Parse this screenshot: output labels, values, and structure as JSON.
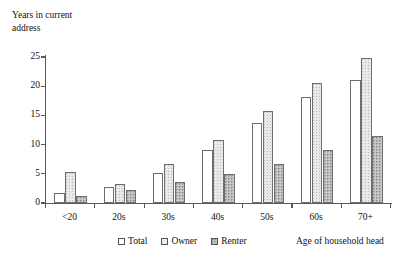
{
  "chart_data": {
    "type": "bar",
    "title": "",
    "ylabel": "Years in current address",
    "xlabel": "Age of household head",
    "categories": [
      "<20",
      "20s",
      "30s",
      "40s",
      "50s",
      "60s",
      "70+"
    ],
    "series": [
      {
        "name": "Total",
        "values": [
          1.7,
          2.8,
          5.2,
          9.0,
          13.7,
          18.2,
          21.0
        ]
      },
      {
        "name": "Owner",
        "values": [
          5.3,
          3.3,
          6.6,
          10.8,
          15.8,
          20.6,
          24.8
        ]
      },
      {
        "name": "Renter",
        "values": [
          1.2,
          2.2,
          3.6,
          5.0,
          6.7,
          9.0,
          11.4
        ]
      }
    ],
    "ylim": [
      0,
      25
    ],
    "yticks": [
      0,
      5,
      10,
      15,
      20,
      25
    ],
    "ytick_labels": [
      "0",
      "5",
      "10",
      "15",
      "20",
      "25"
    ],
    "grid": false,
    "legend_position": "bottom",
    "legend": [
      "Total",
      "Owner",
      "Renter"
    ]
  },
  "axis": {
    "y_title_line1": "Years in current",
    "y_title_line2": "address"
  },
  "colors": {
    "axis": "#5a5a5a",
    "bar_border": "#6e6e6e",
    "total_fill": "#ffffff",
    "owner_fill": "#e9e9e9",
    "renter_fill": "#c9c9c9",
    "text": "#111111"
  }
}
